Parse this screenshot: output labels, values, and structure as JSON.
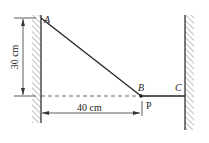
{
  "diagram": {
    "points": {
      "A": {
        "label": "A"
      },
      "B": {
        "label": "B"
      },
      "C": {
        "label": "C"
      },
      "P": {
        "label": "P"
      }
    },
    "dimensions": {
      "vertical": "30 cm",
      "horizontal": "40 cm"
    },
    "colors": {
      "line": "#222222",
      "hatch": "#777777",
      "background": "#ffffff"
    }
  }
}
